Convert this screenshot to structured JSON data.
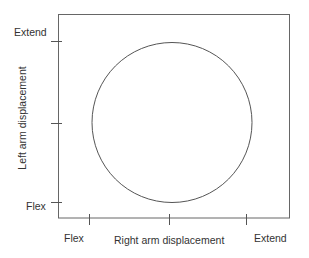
{
  "diagram": {
    "x_axis": {
      "label": "Right arm displacement",
      "ticks": [
        "Flex",
        "Extend"
      ]
    },
    "y_axis": {
      "label": "Left arm displacement",
      "ticks": [
        "Extend",
        "Flex"
      ]
    },
    "shape": "circle",
    "colors": {
      "line": "#555555",
      "text": "#333333"
    }
  }
}
